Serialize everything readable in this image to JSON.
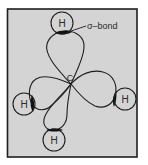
{
  "diagram": {
    "colors": {
      "background": "#ffffff",
      "panel": "#d4d4d4",
      "stroke": "#1e1e1e",
      "overlap": "#111111"
    },
    "central_atom": {
      "label": "C"
    },
    "atoms": [
      {
        "id": "top",
        "label": "H"
      },
      {
        "id": "left",
        "label": "H"
      },
      {
        "id": "right",
        "label": "H"
      },
      {
        "id": "bottom",
        "label": "H"
      }
    ],
    "annotation": {
      "label": "σ–bond"
    }
  }
}
